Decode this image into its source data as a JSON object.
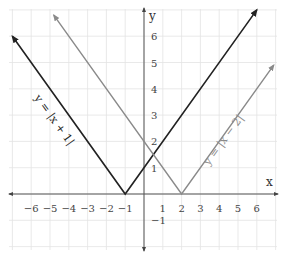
{
  "chart_data": {
    "type": "line",
    "title": "",
    "xlabel": "x",
    "ylabel": "y",
    "xlim": [
      -7,
      7
    ],
    "ylim": [
      -2,
      7
    ],
    "grid": true,
    "legend": "none (inline curve labels)",
    "x_ticks": [
      -6,
      -5,
      -4,
      -3,
      -2,
      -1,
      1,
      2,
      3,
      4,
      5,
      6
    ],
    "x_tick_labels": [
      "−6",
      "−5",
      "−4",
      "−3",
      "−2",
      "−1",
      "1",
      "2",
      "3",
      "4",
      "5",
      "6"
    ],
    "y_ticks": [
      -1,
      1,
      2,
      3,
      4,
      5,
      6
    ],
    "y_tick_labels": [
      "−1",
      "1",
      "2",
      "3",
      "4",
      "5",
      "6"
    ],
    "series": [
      {
        "name": "y = |x + 1|",
        "label": "y = |x + 1|",
        "color": "#222222",
        "x": [
          -7,
          -1,
          6
        ],
        "y": [
          6,
          0,
          7
        ],
        "vertex": [
          -1,
          0
        ]
      },
      {
        "name": "y = |x − 2|",
        "label": "y = |x − 2|",
        "color": "#8a8a8a",
        "x": [
          -4.8,
          2,
          6.9
        ],
        "y": [
          6.8,
          0,
          4.9
        ],
        "vertex": [
          2,
          0
        ]
      }
    ],
    "intersection": [
      0.5,
      1.5
    ]
  }
}
